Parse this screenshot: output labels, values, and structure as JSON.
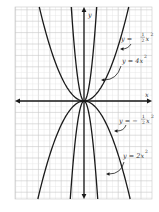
{
  "figure": {
    "axes": {
      "x_label": "x",
      "y_label": "y",
      "origin": [
        84,
        101
      ],
      "grid": {
        "left": 15,
        "top": 7,
        "right": 152,
        "bottom": 199,
        "major_step": 11.4,
        "minor_divisions": 2
      }
    },
    "curves": [
      {
        "name": "y-half-x-squared",
        "equation": "y = 1/2 x^2",
        "direction": "up",
        "k_px": 0.047
      },
      {
        "name": "y-4x-squared",
        "equation": "y = 4x^2",
        "direction": "up",
        "k_px": 0.58
      },
      {
        "name": "y-neg-half-x-squared",
        "equation": "y = -1/2 x^2",
        "direction": "down",
        "k_px": 0.046
      },
      {
        "name": "y-2x-squared",
        "equation": "y = 2x^2",
        "direction": "down",
        "k_px": 0.52
      }
    ],
    "labels": {
      "top_outer": {
        "prefix": "y =",
        "num": "1",
        "den": "2",
        "var": "x",
        "exp": "2"
      },
      "top_inner": {
        "text": "y = 4x",
        "exp": "2"
      },
      "bottom_outer": {
        "prefix": "y = −",
        "num": "1",
        "den": "2",
        "var": "x",
        "exp": "2"
      },
      "bottom_inner": {
        "text": "y = 2x",
        "exp": "2"
      }
    },
    "colors": {
      "grid_major": "#c8c8c8",
      "grid_minor": "#e4e4e4",
      "curve": "#1a1a1a",
      "axis": "#1a1a1a",
      "text": "#333333"
    }
  }
}
